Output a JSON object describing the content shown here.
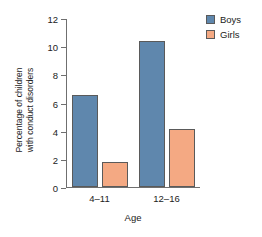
{
  "chart_data": {
    "type": "bar",
    "title": "",
    "xlabel": "Age",
    "ylabel_line1": "Percentage of children",
    "ylabel_line2": "with conduct disorders",
    "categories": [
      "4–11",
      "12–16"
    ],
    "series": [
      {
        "name": "Boys",
        "values": [
          6.5,
          10.4
        ],
        "color": "#5f87ad"
      },
      {
        "name": "Girls",
        "values": [
          1.8,
          4.1
        ],
        "color": "#f4a983"
      }
    ],
    "ylim": [
      0,
      12
    ],
    "ytick_labels": [
      "12",
      "10",
      "8",
      "6",
      "4",
      "2",
      "0"
    ],
    "ytick_values": [
      12,
      10,
      8,
      6,
      4,
      2,
      0
    ],
    "grid": false,
    "legend_position": "top-right"
  }
}
